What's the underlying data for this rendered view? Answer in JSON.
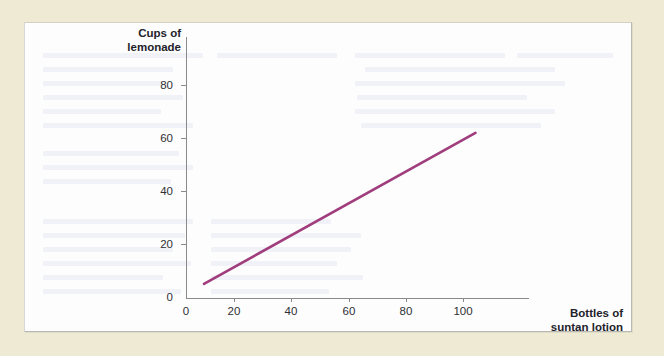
{
  "figure": {
    "panel_background": "#fdfdfd",
    "page_background": "#efead4"
  },
  "chart_data": {
    "type": "line",
    "title": "",
    "xlabel": "Bottles of suntan lotion",
    "ylabel": "Cups of lemonade",
    "xlabel_lines": [
      "Bottles of",
      "suntan lotion"
    ],
    "ylabel_lines": [
      "Cups of",
      "lemonade"
    ],
    "xlim": [
      0,
      113
    ],
    "ylim": [
      0,
      90
    ],
    "xticks": [
      0,
      20,
      40,
      60,
      80,
      100
    ],
    "xtick_labels": [
      "0",
      "20",
      "40",
      "60",
      "80",
      "100"
    ],
    "yticks": [
      0,
      20,
      40,
      60,
      80
    ],
    "ytick_labels": [
      "0",
      "20",
      "40",
      "60",
      "80"
    ],
    "grid": false,
    "legend": false,
    "series": [
      {
        "name": "Lemonade vs suntan lotion",
        "color": "#a03d7d",
        "line_width": 2.6,
        "x": [
          6.5,
          104.5
        ],
        "y": [
          5.3,
          62.0
        ],
        "description": "positive linear trend"
      }
    ]
  },
  "annotations": {
    "none": ""
  }
}
